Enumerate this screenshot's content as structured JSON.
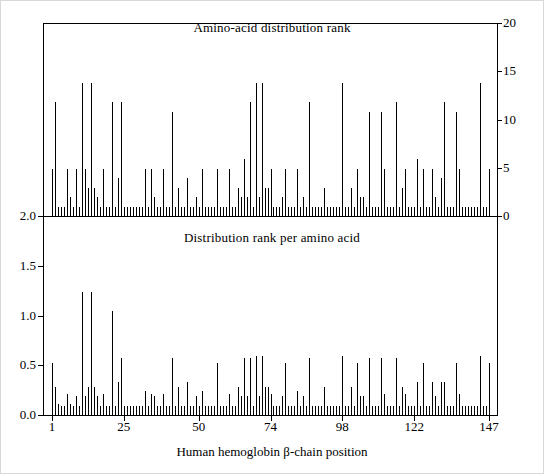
{
  "figure": {
    "xlabel": "Human hemoglobin β-chain position",
    "panels": [
      {
        "title": "Amino-acid distribution rank",
        "axis": "right",
        "yticks": [
          "0",
          "5",
          "10",
          "15",
          "20"
        ],
        "ylim": [
          0,
          20
        ]
      },
      {
        "title": "Distribution rank per amino acid",
        "axis": "left",
        "yticks": [
          "0.0",
          "0.5",
          "1.0",
          "1.5",
          "2.0"
        ],
        "ylim": [
          0,
          2.0
        ]
      }
    ],
    "xticks": [
      "1",
      "25",
      "50",
      "74",
      "98",
      "122",
      "147"
    ]
  },
  "chart_data": {
    "type": "bar",
    "title": "",
    "xlabel": "Human hemoglobin β-chain position",
    "grid": false,
    "legend": "none",
    "x": [
      1,
      2,
      3,
      4,
      5,
      6,
      7,
      8,
      9,
      10,
      11,
      12,
      13,
      14,
      15,
      16,
      17,
      18,
      19,
      20,
      21,
      22,
      23,
      24,
      25,
      26,
      27,
      28,
      29,
      30,
      31,
      32,
      33,
      34,
      35,
      36,
      37,
      38,
      39,
      40,
      41,
      42,
      43,
      44,
      45,
      46,
      47,
      48,
      49,
      50,
      51,
      52,
      53,
      54,
      55,
      56,
      57,
      58,
      59,
      60,
      61,
      62,
      63,
      64,
      65,
      66,
      67,
      68,
      69,
      70,
      71,
      72,
      73,
      74,
      75,
      76,
      77,
      78,
      79,
      80,
      81,
      82,
      83,
      84,
      85,
      86,
      87,
      88,
      89,
      90,
      91,
      92,
      93,
      94,
      95,
      96,
      97,
      98,
      99,
      100,
      101,
      102,
      103,
      104,
      105,
      106,
      107,
      108,
      109,
      110,
      111,
      112,
      113,
      114,
      115,
      116,
      117,
      118,
      119,
      120,
      121,
      122,
      123,
      124,
      125,
      126,
      127,
      128,
      129,
      130,
      131,
      132,
      133,
      134,
      135,
      136,
      137,
      138,
      139,
      140,
      141,
      142,
      143,
      144,
      145,
      146,
      147
    ],
    "series": [
      {
        "name": "Amino-acid distribution rank",
        "axis": "right",
        "ylabel": "",
        "ylim": [
          0,
          20
        ],
        "values": [
          5,
          12,
          1,
          1,
          1,
          5,
          2,
          1,
          5,
          1,
          14,
          5,
          3,
          14,
          3,
          2,
          1,
          5,
          1,
          1,
          12,
          1,
          4,
          12,
          1,
          1,
          1,
          1,
          1,
          1,
          1,
          5,
          1,
          5,
          2,
          1,
          1,
          5,
          1,
          1,
          11,
          1,
          3,
          1,
          1,
          4,
          1,
          1,
          2,
          1,
          5,
          1,
          1,
          1,
          1,
          5,
          1,
          1,
          1,
          5,
          1,
          1,
          3,
          2,
          6,
          2,
          12,
          1,
          14,
          2,
          14,
          3,
          3,
          5,
          1,
          1,
          1,
          2,
          5,
          1,
          1,
          1,
          5,
          1,
          2,
          1,
          12,
          1,
          1,
          1,
          1,
          3,
          1,
          1,
          1,
          1,
          1,
          14,
          1,
          1,
          3,
          1,
          5,
          2,
          2,
          1,
          11,
          1,
          1,
          1,
          11,
          5,
          1,
          1,
          1,
          12,
          1,
          3,
          5,
          1,
          1,
          1,
          6,
          1,
          5,
          1,
          1,
          5,
          2,
          1,
          4,
          12,
          1,
          1,
          1,
          11,
          5,
          1,
          1,
          1,
          1,
          1,
          1,
          14,
          1,
          1,
          5
        ]
      },
      {
        "name": "Distribution rank per amino acid",
        "axis": "left",
        "ylabel": "",
        "ylim": [
          0,
          2.0
        ],
        "values": [
          0.55,
          0.3,
          0.12,
          0.1,
          0.1,
          0.22,
          0.12,
          0.1,
          0.2,
          0.1,
          1.3,
          0.2,
          0.3,
          1.3,
          0.3,
          0.2,
          0.1,
          0.22,
          0.1,
          0.1,
          1.1,
          0.1,
          0.35,
          0.6,
          0.1,
          0.1,
          0.1,
          0.1,
          0.1,
          0.1,
          0.1,
          0.25,
          0.1,
          0.22,
          0.2,
          0.1,
          0.1,
          0.22,
          0.1,
          0.1,
          0.6,
          0.1,
          0.3,
          0.1,
          0.1,
          0.35,
          0.1,
          0.1,
          0.2,
          0.1,
          0.25,
          0.1,
          0.1,
          0.1,
          0.1,
          0.55,
          0.1,
          0.1,
          0.1,
          0.22,
          0.1,
          0.1,
          0.3,
          0.2,
          0.6,
          0.2,
          0.6,
          0.1,
          0.62,
          0.2,
          0.62,
          0.3,
          0.3,
          0.22,
          0.1,
          0.1,
          0.1,
          0.2,
          0.55,
          0.1,
          0.1,
          0.1,
          0.25,
          0.1,
          0.2,
          0.1,
          0.6,
          0.1,
          0.1,
          0.1,
          0.1,
          0.3,
          0.1,
          0.1,
          0.1,
          0.1,
          0.1,
          0.62,
          0.1,
          0.1,
          0.3,
          0.1,
          0.55,
          0.2,
          0.2,
          0.1,
          0.6,
          0.1,
          0.1,
          0.1,
          0.6,
          0.22,
          0.1,
          0.1,
          0.1,
          0.6,
          0.1,
          0.3,
          0.22,
          0.1,
          0.1,
          0.1,
          0.35,
          0.1,
          0.55,
          0.1,
          0.1,
          0.35,
          0.2,
          0.1,
          0.35,
          0.35,
          0.1,
          0.1,
          0.1,
          0.55,
          0.22,
          0.1,
          0.1,
          0.1,
          0.1,
          0.1,
          0.1,
          0.62,
          0.1,
          0.1,
          0.55
        ]
      }
    ]
  }
}
